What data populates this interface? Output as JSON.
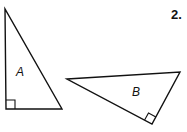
{
  "problem_number": "2.",
  "figures": [
    {
      "label": "A",
      "shape": "right-triangle",
      "right_angle_marker": true,
      "vertices": [
        [
          5,
          9
        ],
        [
          6,
          109
        ],
        [
          62,
          109
        ]
      ]
    },
    {
      "label": "B",
      "shape": "right-triangle",
      "right_angle_marker": true,
      "vertices": [
        [
          67,
          79
        ],
        [
          180,
          72
        ],
        [
          152,
          124
        ]
      ]
    }
  ],
  "colors": {
    "stroke": "#111111",
    "background": "#ffffff"
  }
}
